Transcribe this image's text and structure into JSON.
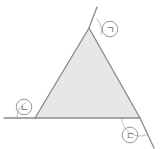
{
  "figure": {
    "background_color": "#ffffff",
    "shape": {
      "type": "triangle",
      "fill_color": "#e7e7e7",
      "stroke_color": "#8a8a8a",
      "stroke_width": 1.3,
      "vertices": [
        {
          "name": "apex",
          "x": 89,
          "y": 28
        },
        {
          "name": "bottom-left",
          "x": 35,
          "y": 118
        },
        {
          "name": "bottom-right",
          "x": 140,
          "y": 118
        }
      ]
    },
    "extension_lines": [
      {
        "name": "left-side-extension",
        "description": "left side extended upward beyond the apex",
        "x1": 89,
        "y1": 28,
        "x2": 97,
        "y2": 7,
        "color": "#8a8a8a"
      },
      {
        "name": "base-extension",
        "description": "base extended leftward beyond the bottom-left vertex",
        "x1": 35,
        "y1": 118,
        "x2": 4,
        "y2": 118,
        "color": "#8a8a8a"
      },
      {
        "name": "right-side-extension",
        "description": "right side extended downward beyond the bottom-right vertex",
        "x1": 140,
        "y1": 118,
        "x2": 154,
        "y2": 148,
        "color": "#8a8a8a"
      }
    ],
    "angle_arcs": [
      {
        "name": "arc-giyeok",
        "cx": 89,
        "cy": 28,
        "r": 18,
        "color": "#b5b5b5"
      },
      {
        "name": "arc-nieun",
        "cx": 35,
        "cy": 118,
        "r": 18,
        "color": "#b5b5b5"
      },
      {
        "name": "arc-digeut",
        "cx": 140,
        "cy": 118,
        "r": 18,
        "color": "#b5b5b5"
      }
    ],
    "labels": [
      {
        "name": "label-giyeok",
        "text": "㈀",
        "character": "ㄱ",
        "cx": 110,
        "cy": 29,
        "r": 8,
        "circle_color": "#9a9a9a",
        "text_color": "#6b6b6b"
      },
      {
        "name": "label-nieun",
        "text": "㈁",
        "character": "ㄴ",
        "cx": 24,
        "cy": 107,
        "r": 8,
        "circle_color": "#9a9a9a",
        "text_color": "#6b6b6b"
      },
      {
        "name": "label-digeut",
        "text": "㈂",
        "character": "ㄷ",
        "cx": 130,
        "cy": 135,
        "r": 8,
        "circle_color": "#9a9a9a",
        "text_color": "#6b6b6b"
      }
    ]
  }
}
